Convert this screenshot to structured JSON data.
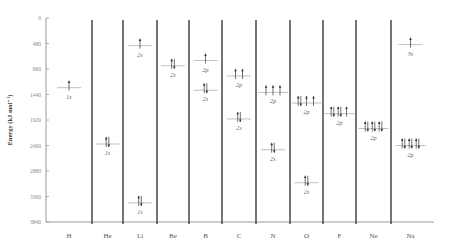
{
  "chart_data": {
    "type": "energy-level-diagram",
    "title": "",
    "ylabel": "Energy (kJ mol⁻¹)",
    "ylim": [
      0,
      3840
    ],
    "y_inverted": true,
    "yticks": [
      0,
      480,
      960,
      1440,
      1920,
      2400,
      2880,
      3360,
      3840
    ],
    "elements": [
      {
        "symbol": "H",
        "orbitals": [
          {
            "name": "1s",
            "energy": 1312,
            "electrons": [
              1
            ]
          }
        ]
      },
      {
        "symbol": "He",
        "orbitals": [
          {
            "name": "1s",
            "energy": 2372,
            "electrons": [
              2
            ]
          }
        ]
      },
      {
        "symbol": "Li",
        "orbitals": [
          {
            "name": "2s",
            "energy": 520,
            "electrons": [
              1
            ]
          },
          {
            "name": "1s",
            "energy": 3480,
            "electrons": [
              2
            ]
          }
        ]
      },
      {
        "symbol": "Be",
        "orbitals": [
          {
            "name": "2s",
            "energy": 900,
            "electrons": [
              2
            ]
          }
        ]
      },
      {
        "symbol": "B",
        "orbitals": [
          {
            "name": "2p",
            "energy": 800,
            "electrons": [
              1
            ]
          },
          {
            "name": "2s",
            "energy": 1360,
            "electrons": [
              2
            ]
          }
        ]
      },
      {
        "symbol": "C",
        "orbitals": [
          {
            "name": "2p",
            "energy": 1090,
            "electrons": [
              1,
              1
            ]
          },
          {
            "name": "2s",
            "energy": 1900,
            "electrons": [
              2
            ]
          }
        ]
      },
      {
        "symbol": "N",
        "orbitals": [
          {
            "name": "2p",
            "energy": 1400,
            "electrons": [
              1,
              1,
              1
            ]
          },
          {
            "name": "2s",
            "energy": 2480,
            "electrons": [
              2
            ]
          }
        ]
      },
      {
        "symbol": "O",
        "orbitals": [
          {
            "name": "2p",
            "energy": 1600,
            "electrons": [
              2,
              1,
              1
            ]
          },
          {
            "name": "2s",
            "energy": 3100,
            "electrons": [
              2
            ]
          }
        ]
      },
      {
        "symbol": "F",
        "orbitals": [
          {
            "name": "2p",
            "energy": 1800,
            "electrons": [
              2,
              2,
              1
            ]
          }
        ]
      },
      {
        "symbol": "Ne",
        "orbitals": [
          {
            "name": "2p",
            "energy": 2080,
            "electrons": [
              2,
              2,
              2
            ]
          }
        ]
      },
      {
        "symbol": "Na",
        "orbitals": [
          {
            "name": "3s",
            "energy": 500,
            "electrons": [
              1
            ]
          },
          {
            "name": "2p",
            "energy": 2400,
            "electrons": [
              2,
              2,
              2
            ]
          }
        ]
      }
    ]
  },
  "colors": {
    "axis": "#9a9a9a",
    "divider": "#3a3a3a",
    "level": "#b0b0b0",
    "arrow": "#333333"
  }
}
